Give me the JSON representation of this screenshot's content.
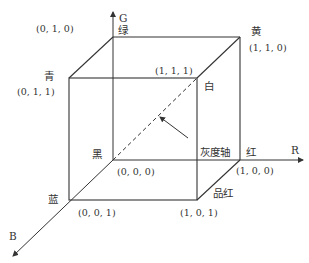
{
  "diagram": {
    "axes": {
      "g": {
        "name": "G",
        "color_label": "绿"
      },
      "r": {
        "name": "R",
        "color_label": "红"
      },
      "b": {
        "name": "B",
        "color_label": "蓝"
      }
    },
    "vertices": {
      "green": {
        "label": "",
        "coord": "(0, 1, 0)"
      },
      "yellow": {
        "label": "黄",
        "coord": "(1, 1, 0)"
      },
      "cyan": {
        "label": "青",
        "coord": "(0, 1, 1)"
      },
      "white": {
        "label": "白",
        "coord": "(1, 1, 1)"
      },
      "black": {
        "label": "黑",
        "coord": "(0, 0, 0)"
      },
      "red": {
        "label": "红",
        "coord": "(1, 0, 0)"
      },
      "blue": {
        "label": "蓝",
        "coord": "(0, 0, 1)"
      },
      "magenta": {
        "label": "品红",
        "coord": "(1, 0, 1)"
      }
    },
    "gray_axis_label": "灰度轴",
    "line_color": "#333333"
  }
}
